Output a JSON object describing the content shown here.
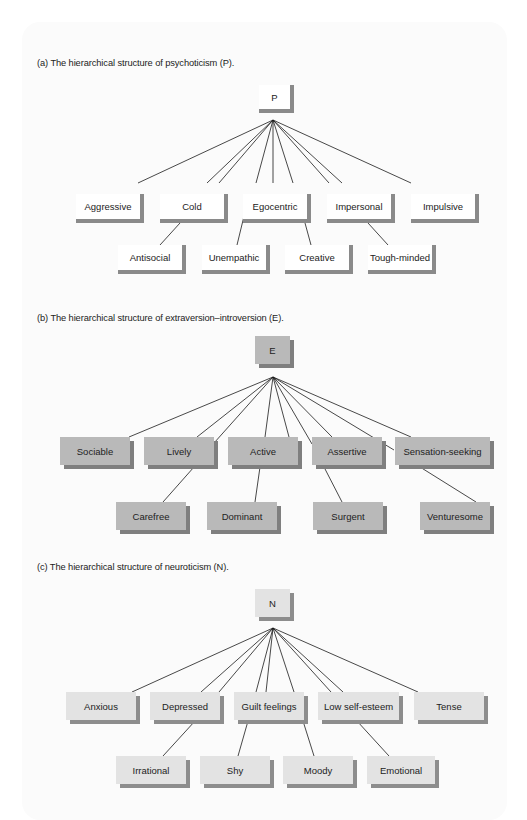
{
  "figure": {
    "sections": [
      {
        "id": "a",
        "caption": "(a) The hierarchical structure of psychoticism (P).",
        "root": "P",
        "primary": [
          "Aggressive",
          "Cold",
          "Egocentric",
          "Impersonal",
          "Impulsive"
        ],
        "secondary": [
          "Antisocial",
          "Unempathic",
          "Creative",
          "Tough-minded"
        ]
      },
      {
        "id": "b",
        "caption": "(b) The hierarchical structure of extraversion–introversion (E).",
        "root": "E",
        "primary": [
          "Sociable",
          "Lively",
          "Active",
          "Assertive",
          "Sensation-seeking"
        ],
        "secondary": [
          "Carefree",
          "Dominant",
          "Surgent",
          "Venturesome"
        ]
      },
      {
        "id": "c",
        "caption": "(c) The hierarchical structure of neuroticism (N).",
        "root": "N",
        "primary": [
          "Anxious",
          "Depressed",
          "Guilt feelings",
          "Low self-esteem",
          "Tense"
        ],
        "secondary": [
          "Irrational",
          "Shy",
          "Moody",
          "Emotional"
        ]
      }
    ]
  },
  "colors": {
    "line": "#1a1a1a",
    "shadow_a": "#8a8a8a",
    "fill_b": "#b9b9b9",
    "shadow_b": "#7f7f7f",
    "fill_c": "#e3e3e3",
    "shadow_c": "#8d8d8d"
  }
}
